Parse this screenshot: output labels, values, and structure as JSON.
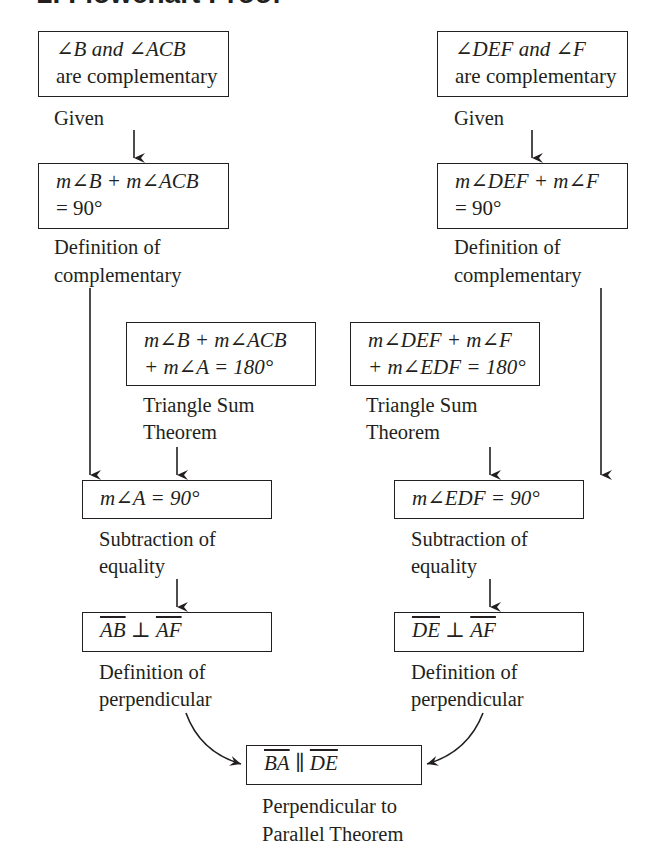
{
  "title": "2. Flowchart Proof",
  "left_column": [
    {
      "statement_lines": [
        "∠B and ∠ACB",
        "are complementary"
      ],
      "reason": [
        "Given"
      ]
    },
    {
      "statement_lines": [
        "m∠B + m∠ACB",
        "= 90°"
      ],
      "reason": [
        "Definition of",
        "complementary"
      ]
    },
    {
      "statement_lines": [
        "m∠B + m∠ACB",
        "+ m∠A = 180°"
      ],
      "reason": [
        "Triangle Sum",
        "Theorem"
      ]
    },
    {
      "statement_lines": [
        "m∠A = 90°"
      ],
      "reason": [
        "Subtraction of",
        "equality"
      ]
    },
    {
      "statement_parts": {
        "seg1": "AB",
        "symbol": " ⊥ ",
        "seg2": "AF"
      },
      "reason": [
        "Definition of",
        "perpendicular"
      ]
    }
  ],
  "right_column": [
    {
      "statement_lines": [
        "∠DEF and ∠F",
        "are complementary"
      ],
      "reason": [
        "Given"
      ]
    },
    {
      "statement_lines": [
        "m∠DEF + m∠F",
        "= 90°"
      ],
      "reason": [
        "Definition of",
        "complementary"
      ]
    },
    {
      "statement_lines": [
        "m∠DEF + m∠F",
        "+ m∠EDF = 180°"
      ],
      "reason": [
        "Triangle Sum",
        "Theorem"
      ]
    },
    {
      "statement_lines": [
        "m∠EDF = 90°"
      ],
      "reason": [
        "Subtraction of",
        "equality"
      ]
    },
    {
      "statement_parts": {
        "seg1": "DE",
        "symbol": " ⊥ ",
        "seg2": "AF"
      },
      "reason": [
        "Definition of",
        "perpendicular"
      ]
    }
  ],
  "conclusion": {
    "statement_parts": {
      "seg1": "BA",
      "symbol": " ∥ ",
      "seg2": "DE"
    },
    "reason": [
      "Perpendicular to",
      "Parallel Theorem"
    ]
  },
  "colors": {
    "ink": "#231f20",
    "background": "#ffffff"
  }
}
